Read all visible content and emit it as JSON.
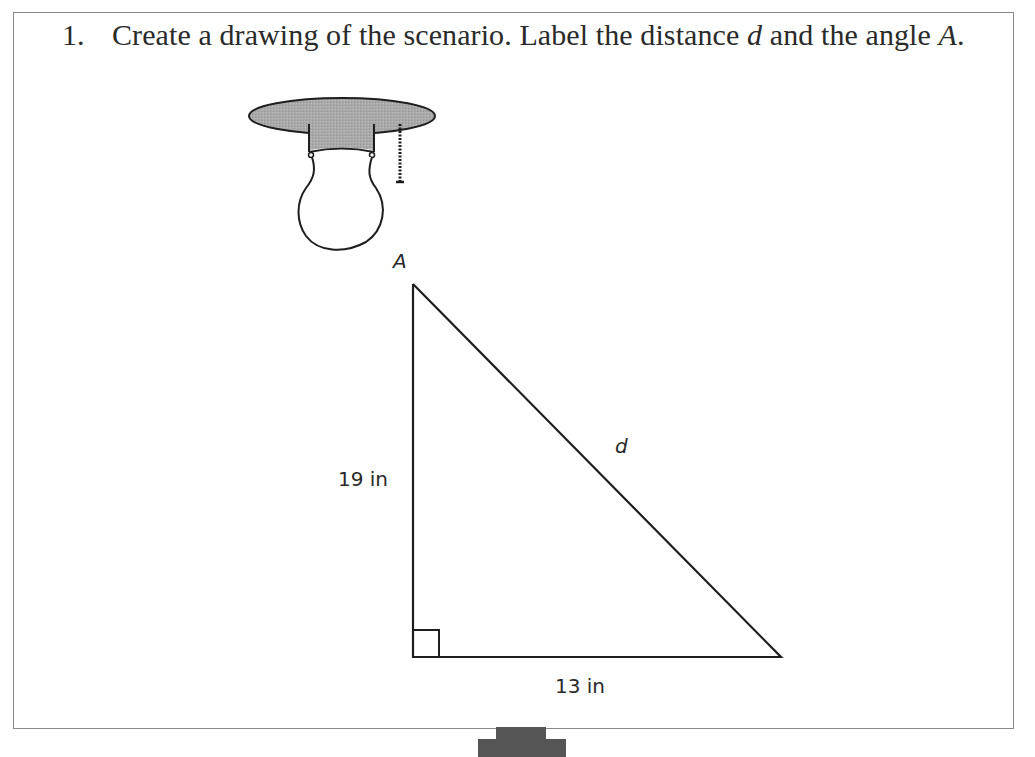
{
  "problem": {
    "number": "1.",
    "text_before_d": "Create a drawing of the scenario. Label the distance ",
    "var_d": "d",
    "text_between": " and the angle ",
    "var_A": "A",
    "text_end": "."
  },
  "diagram": {
    "illustration": "ceiling-light-bulb-with-pull-chain",
    "triangle": {
      "angle_label": "A",
      "hypotenuse_label": "d",
      "vertical_leg_label": "19 in",
      "horizontal_leg_label": "13 in",
      "right_angle_marker": "bottom-left"
    }
  },
  "next_arrow": {
    "icon": "down-arrow-icon",
    "color": "#555555"
  },
  "colors": {
    "frame_border": "#8a8a8a",
    "line": "#1e1e1e",
    "fixture_fill": "#a8a8a8",
    "text": "#2a2a2a"
  }
}
